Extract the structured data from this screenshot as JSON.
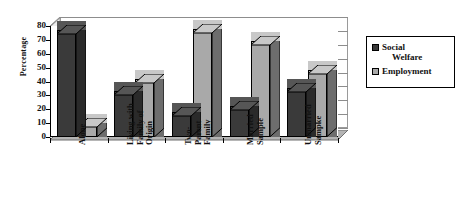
{
  "chart_data": {
    "type": "bar",
    "title": "",
    "xlabel": "",
    "ylabel": "Percentage",
    "ylim": [
      0,
      80
    ],
    "yticks": [
      0,
      10,
      20,
      30,
      40,
      50,
      60,
      70,
      80
    ],
    "ytick_labels": [
      "0",
      "10",
      "20",
      "30",
      "40",
      "50",
      "60",
      "70",
      "80"
    ],
    "grid": true,
    "legend_position": "right",
    "style": "3d-clustered-column",
    "categories": [
      "Alone",
      "Living with Family of Origin",
      "Two-Parent Family",
      "Married Sample",
      "Unmarried Sample"
    ],
    "category_lines": [
      [
        "Alone"
      ],
      [
        "Living with",
        "Family of",
        "Origin"
      ],
      [
        "Two-",
        "Parent",
        "Family"
      ],
      [
        "Married",
        "Sample"
      ],
      [
        "Unmarried",
        "Sampke"
      ]
    ],
    "series": [
      {
        "name": "Social Welfare",
        "color": "#3a3a3a",
        "values": [
          77,
          33,
          18,
          22,
          35
        ]
      },
      {
        "name": "Employment",
        "color": "#a9a9a9",
        "values": [
          10,
          42,
          78,
          69,
          48
        ]
      }
    ]
  },
  "legend": {
    "items": [
      {
        "label_lines": [
          "Social",
          "Welfare"
        ],
        "swatch": "#3a3a3a"
      },
      {
        "label_lines": [
          "Employment"
        ],
        "swatch": "#a9a9a9"
      }
    ]
  },
  "axes": {
    "y_title": "Percentage"
  }
}
